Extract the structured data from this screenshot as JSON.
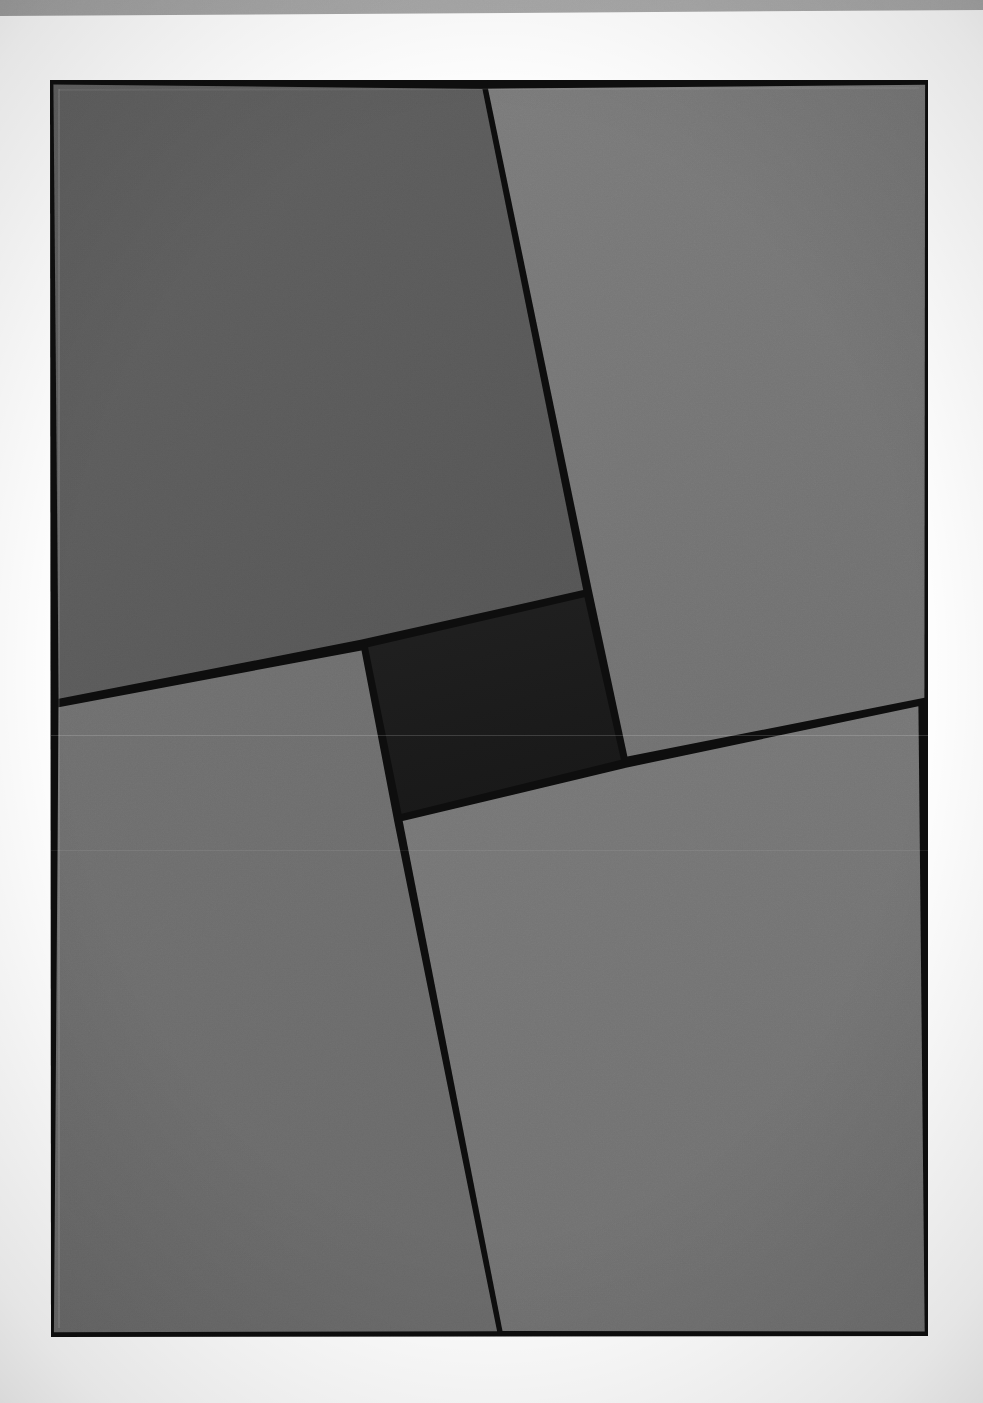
{
  "page": {
    "width": 983,
    "height": 1403,
    "background_color": "#ffffff",
    "medium": "scanned print / photographic plate"
  },
  "top_band": {
    "name": "top-gray-band",
    "color": "#a5a5a5",
    "left_thickness_px": 16,
    "right_thickness_px": 10,
    "y_top": 0,
    "y_bottom_left": 16,
    "y_bottom_right": 10
  },
  "plate": {
    "name": "artwork-plate",
    "border_color": "#0d0d0d",
    "border_thickness_px": 9,
    "corners": {
      "top_left": [
        50,
        80
      ],
      "top_right": [
        928,
        80
      ],
      "bottom_right": [
        928,
        1336
      ],
      "bottom_left": [
        51,
        1337
      ]
    }
  },
  "palette": {
    "black_line": "#0d0d0d",
    "band_gray": "#a5a5a5",
    "field_top_left": "#5a5a5a",
    "field_top_right": "#767676",
    "field_bottom_left": "#6e6e6e",
    "field_bottom_right": "#757575",
    "center_dark": "#1c1c1c",
    "paper_white": "#ffffff"
  },
  "divider_lines": [
    {
      "name": "upper-vertical-divider",
      "thickness_px": 9,
      "from": [
        485,
        84
      ],
      "to": [
        588,
        593
      ],
      "description": "near-vertical line from top edge down to the top-right corner of the center rectangle"
    },
    {
      "name": "lower-vertical-divider",
      "thickness_px": 9,
      "from": [
        398,
        818
      ],
      "to": [
        500,
        1336
      ],
      "description": "near-vertical line from the bottom-left corner of the center rectangle down to the bottom edge"
    },
    {
      "name": "left-horizontal-divider",
      "thickness_px": 9,
      "from": [
        55,
        703
      ],
      "to": [
        363,
        645
      ],
      "description": "slightly rising line from the left edge to the top-left corner of the center rectangle"
    },
    {
      "name": "right-horizontal-divider",
      "thickness_px": 9,
      "from": [
        626,
        762
      ],
      "to": [
        922,
        702
      ],
      "description": "slightly rising line from the bottom-right corner of the center rectangle to the right edge"
    }
  ],
  "fields": [
    {
      "name": "field-top-left",
      "label": "upper-left gray field",
      "fill": "#5a5a5a",
      "polygon": [
        [
          50,
          80
        ],
        [
          485,
          84
        ],
        [
          588,
          593
        ],
        [
          363,
          645
        ],
        [
          55,
          703
        ]
      ]
    },
    {
      "name": "field-top-right",
      "label": "upper-right gray field",
      "fill": "#767676",
      "polygon": [
        [
          485,
          84
        ],
        [
          928,
          80
        ],
        [
          928,
          702
        ],
        [
          626,
          762
        ],
        [
          588,
          593
        ]
      ]
    },
    {
      "name": "field-bottom-left",
      "label": "lower-left gray field",
      "fill": "#6e6e6e",
      "polygon": [
        [
          55,
          703
        ],
        [
          363,
          645
        ],
        [
          398,
          818
        ],
        [
          500,
          1336
        ],
        [
          51,
          1337
        ]
      ]
    },
    {
      "name": "field-bottom-right",
      "label": "lower-right gray field",
      "fill": "#757575",
      "polygon": [
        [
          398,
          818
        ],
        [
          626,
          762
        ],
        [
          922,
          702
        ],
        [
          928,
          1336
        ],
        [
          500,
          1336
        ]
      ]
    },
    {
      "name": "field-center-dark",
      "label": "central dark rectangle",
      "fill": "#1c1c1c",
      "polygon": [
        [
          363,
          645
        ],
        [
          588,
          593
        ],
        [
          626,
          762
        ],
        [
          398,
          818
        ]
      ]
    }
  ],
  "center_rectangle": {
    "name": "center-dark-rectangle",
    "fill": "#1c1c1c",
    "corners": {
      "top_left": [
        363,
        645
      ],
      "top_right": [
        588,
        593
      ],
      "bottom_right": [
        626,
        762
      ],
      "bottom_left": [
        398,
        818
      ]
    },
    "approx_width_px": 231,
    "approx_height_px": 175,
    "rotation_deg": -13.0
  }
}
